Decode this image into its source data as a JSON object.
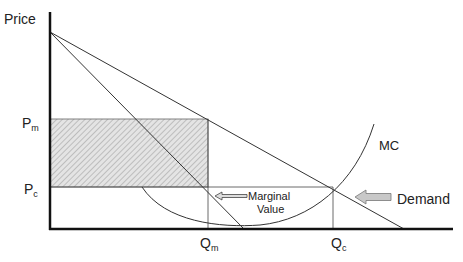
{
  "diagram": {
    "type": "monopoly-vs-competition",
    "y_axis_label": "Price",
    "price_labels": {
      "monopoly": {
        "main": "P",
        "sub": "m"
      },
      "competitive": {
        "main": "P",
        "sub": "c"
      }
    },
    "quantity_labels": {
      "monopoly": {
        "main": "Q",
        "sub": "m"
      },
      "competitive": {
        "main": "Q",
        "sub": "c"
      }
    },
    "curves": {
      "mc_label": "MC",
      "demand_label": "Demand"
    },
    "annotations": {
      "marginal_value_line1": "Marginal",
      "marginal_value_line2": "Value"
    },
    "colors": {
      "axis": "#111111",
      "line": "#333333",
      "hatch_fill": "#cccccc",
      "arrow_fill": "#c8c8c8"
    }
  }
}
